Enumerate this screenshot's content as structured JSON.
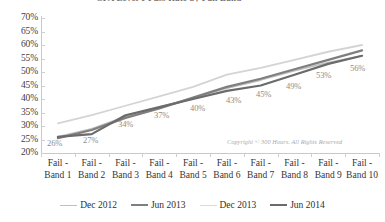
{
  "chart_data": {
    "type": "line",
    "title": "",
    "xlabel": "",
    "ylabel": "",
    "ylim": [
      20,
      70
    ],
    "ytick_step": 5,
    "grid": false,
    "legend_position": "bottom",
    "categories": [
      "Fail - Band 1",
      "Fail - Band 2",
      "Fail - Band 3",
      "Fail - Band 4",
      "Fail - Band 5",
      "Fail - Band 6",
      "Fail - Band 7",
      "Fail - Band 8",
      "Fail - Band 9",
      "Fail - Band 10"
    ],
    "ytick_labels": [
      "70%",
      "65%",
      "60%",
      "55%",
      "50%",
      "45%",
      "40%",
      "35%",
      "30%",
      "25%",
      "20%"
    ],
    "series": [
      {
        "name": "Dec 2012",
        "color": "#bfbfbf",
        "width": 1.6,
        "values": [
          26.0,
          29.0,
          33.5,
          37.0,
          40.5,
          44.0,
          47.0,
          50.5,
          53.5,
          56.0
        ]
      },
      {
        "name": "Jun 2013",
        "color": "#7f7f7f",
        "width": 2.2,
        "values": [
          25.5,
          28.5,
          33.0,
          36.5,
          40.5,
          44.5,
          47.5,
          51.0,
          54.5,
          58.0
        ]
      },
      {
        "name": "Dec 2013",
        "color": "#d4d4d4",
        "width": 1.8,
        "values": [
          31.0,
          34.0,
          37.5,
          41.0,
          44.5,
          49.0,
          51.5,
          54.5,
          57.5,
          60.0
        ]
      },
      {
        "name": "Jun 2014",
        "color": "#6b6b6b",
        "width": 2.2,
        "values": [
          26.0,
          27.0,
          34.0,
          37.0,
          40.0,
          43.0,
          45.0,
          49.0,
          53.0,
          56.0
        ]
      }
    ],
    "data_labels": [
      {
        "text": "26%",
        "x": 47,
        "y": 139
      },
      {
        "text": "27%",
        "x": 83,
        "y": 136
      },
      {
        "text": "34%",
        "x": 118,
        "y": 120
      },
      {
        "text": "37%",
        "x": 154,
        "y": 111
      },
      {
        "text": "40%",
        "x": 190,
        "y": 104
      },
      {
        "text": "43%",
        "x": 226,
        "y": 96
      },
      {
        "text": "45%",
        "x": 256,
        "y": 90
      },
      {
        "text": "49%",
        "x": 286,
        "y": 82
      },
      {
        "text": "53%",
        "x": 316,
        "y": 71
      },
      {
        "text": "56%",
        "x": 350,
        "y": 64
      }
    ],
    "annotation": "Copyright © 300 Hours. All Rights Reserved",
    "title_sliver": "CFA Level 1 Pass Rate by Fail Band"
  },
  "legend": {
    "items": [
      {
        "label": "Dec 2012",
        "color": "#bfbfbf",
        "width": "1.6px"
      },
      {
        "label": "Jun 2013",
        "color": "#7f7f7f",
        "width": "2.4px"
      },
      {
        "label": "Dec 2013",
        "color": "#dadada",
        "width": "1.6px"
      },
      {
        "label": "Jun 2014",
        "color": "#6b6b6b",
        "width": "2.4px"
      }
    ]
  }
}
